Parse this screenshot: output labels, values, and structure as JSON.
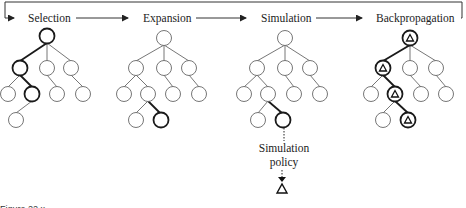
{
  "diagram": {
    "stages": [
      {
        "label": "Selection",
        "label_x": 28,
        "label_y": 22
      },
      {
        "label": "Expansion",
        "label_x": 143,
        "label_y": 22
      },
      {
        "label": "Simulation",
        "label_x": 261,
        "label_y": 22
      },
      {
        "label": "Backpropagation",
        "label_x": 376,
        "label_y": 22
      }
    ],
    "flow": "Selection → Expansion → Simulation → Backpropagation → (loop back to Selection)",
    "simulation_policy_label_line1": "Simulation",
    "simulation_policy_label_line2": "policy",
    "caption": "Figure 22.x",
    "colors": {
      "line": "#555555",
      "highlight": "#1a1a1a",
      "text": "#222222"
    }
  }
}
